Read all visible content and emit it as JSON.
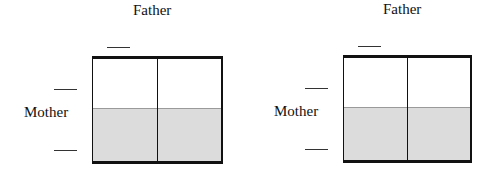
{
  "punnett_squares": [
    {
      "top_label": "Father",
      "side_label": "Mother",
      "father_alleles": [
        ""
      ],
      "mother_alleles": [
        "",
        ""
      ],
      "grid": {
        "rows": 2,
        "cols": 2,
        "shaded_row": 2
      }
    },
    {
      "top_label": "Father",
      "side_label": "Mother",
      "father_alleles": [
        ""
      ],
      "mother_alleles": [
        "",
        ""
      ],
      "grid": {
        "rows": 2,
        "cols": 2,
        "shaded_row": 2
      }
    }
  ],
  "colors": {
    "shade": "#dcdcdc",
    "line": "#111111"
  }
}
